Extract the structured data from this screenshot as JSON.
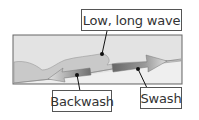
{
  "diagram": {
    "labels": {
      "wave": "Low, long wave",
      "backwash": "Backwash",
      "swash": "Swash"
    },
    "colors": {
      "sky": "#e4e4e4",
      "sea": "#c8c8c8",
      "beach": "#eeeeee",
      "swash_arrow_dark": "#6a6a6a",
      "swash_arrow_light": "#d8d8d8",
      "backwash_arrow_dark": "#707070",
      "backwash_arrow_light": "#dcdcdc",
      "outline": "#555555"
    }
  }
}
